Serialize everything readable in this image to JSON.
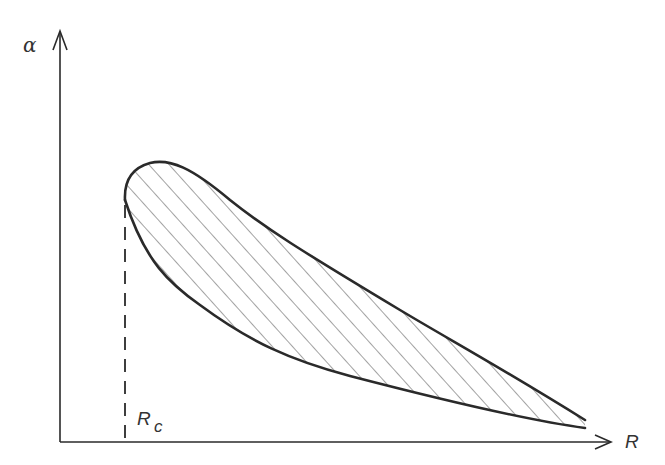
{
  "figure": {
    "y_axis_label": "α",
    "x_axis_label": "R",
    "critical_label_main": "R",
    "critical_label_sub": "c",
    "colors": {
      "stroke": "#2a2a2a",
      "hatch": "#555555",
      "background": "#ffffff"
    }
  }
}
